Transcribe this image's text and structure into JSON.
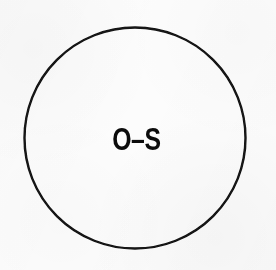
{
  "figure": {
    "type": "line-art-diagram",
    "background_color": "#fcfcfc",
    "stroke_color": "#121212",
    "label_color": "#0c0c0c",
    "shape": {
      "name": "circle",
      "center_x": 135,
      "center_y": 138,
      "diameter": 221,
      "stroke_width": 2.4,
      "fill": "none"
    },
    "label": {
      "text": "O–S",
      "characters": [
        "O",
        "–",
        "S"
      ],
      "weight": "bold",
      "cap_height_px": 25,
      "center_x": 133,
      "center_y": 139
    }
  }
}
